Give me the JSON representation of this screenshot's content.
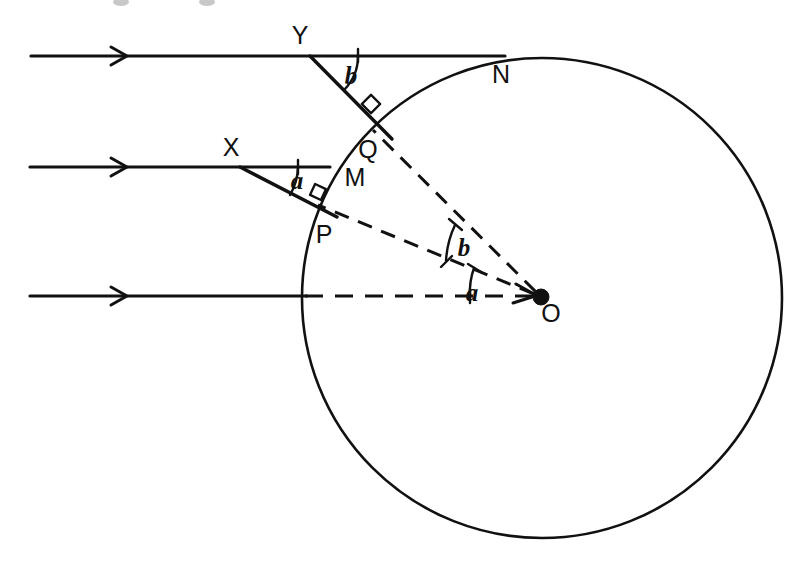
{
  "figure": {
    "title": "Ray diagram of two parallel light rays refracting into a spherical water drop",
    "background_color": "#ffffff",
    "ink_color": "#111111",
    "width": 800,
    "height": 569
  },
  "circle": {
    "name": "water-drop",
    "center_x": 542,
    "center_y": 298,
    "radius": 240,
    "stroke_width": 2.6
  },
  "center_point": {
    "label": "O",
    "x": 541,
    "y": 297,
    "dot_radius": 8,
    "label_x": 551,
    "label_y": 322
  },
  "points": [
    {
      "label": "Y",
      "x": 310,
      "y": 56,
      "label_x": 300,
      "label_y": 44,
      "role": "upper-entry-point"
    },
    {
      "label": "N",
      "x": 505,
      "y": 57,
      "label_x": 501,
      "label_y": 83,
      "role": "upper-ray-circle-crossing"
    },
    {
      "label": "Q",
      "x": 381,
      "y": 127,
      "label_x": 368,
      "label_y": 158,
      "role": "upper-refraction-point"
    },
    {
      "label": "X",
      "x": 240,
      "y": 167,
      "label_x": 231,
      "label_y": 156,
      "role": "lower-entry-point"
    },
    {
      "label": "M",
      "x": 326,
      "y": 167,
      "label_x": 355,
      "label_y": 186,
      "role": "lower-ray-circle-crossing"
    },
    {
      "label": "P",
      "x": 325,
      "y": 211,
      "label_x": 324,
      "label_y": 243,
      "role": "lower-refraction-point"
    }
  ],
  "incident_rays": [
    {
      "name": "upper-incident-ray",
      "x1": 31,
      "y1": 56,
      "x2": 505,
      "y2": 56,
      "arrow_x": 125,
      "arrow_y": 56
    },
    {
      "name": "middle-incident-ray",
      "x1": 30,
      "y1": 167,
      "x2": 330,
      "y2": 167,
      "arrow_x": 125,
      "arrow_y": 167
    },
    {
      "name": "axis-incident-ray",
      "x1": 30,
      "y1": 296,
      "x2": 307,
      "y2": 296,
      "arrow_x": 125,
      "arrow_y": 296
    }
  ],
  "refracted_rays": [
    {
      "name": "upper-refracted-ray",
      "x1": 310,
      "y1": 56,
      "x2": 392,
      "y2": 139
    },
    {
      "name": "lower-refracted-ray",
      "x1": 240,
      "y1": 167,
      "x2": 337,
      "y2": 217
    }
  ],
  "radii_dashed": [
    {
      "name": "radius-to-Q",
      "x1": 541,
      "y1": 297,
      "x2": 373,
      "y2": 130
    },
    {
      "name": "radius-to-P",
      "x1": 541,
      "y1": 297,
      "x2": 318,
      "y2": 205
    },
    {
      "name": "axis-dashed",
      "x1": 541,
      "y1": 297,
      "x2": 307,
      "y2": 296
    }
  ],
  "angles": [
    {
      "name": "angle-b-at-Y",
      "label": "b",
      "label_x": 351,
      "label_y": 84,
      "vertex": "Y",
      "arc_radius": 48
    },
    {
      "name": "angle-a-at-X",
      "label": "a",
      "label_x": 297,
      "label_y": 189,
      "vertex": "X",
      "arc_radius": 58
    },
    {
      "name": "angle-b-at-O",
      "label": "b",
      "label_x": 464,
      "label_y": 256,
      "vertex": "O",
      "arc_radius": 96
    },
    {
      "name": "angle-a-at-O",
      "label": "a",
      "label_x": 472,
      "label_y": 301,
      "vertex": "O",
      "arc_radius": 71
    }
  ],
  "right_angle_marks": [
    {
      "name": "right-angle-at-Q",
      "cx": 371,
      "cy": 103,
      "size": 13,
      "rotation": -45
    },
    {
      "name": "right-angle-at-P",
      "cx": 318,
      "cy": 192,
      "size": 12,
      "rotation": -22
    }
  ],
  "dash_patterns": {
    "radius": "15 10",
    "axis": "18 12"
  }
}
